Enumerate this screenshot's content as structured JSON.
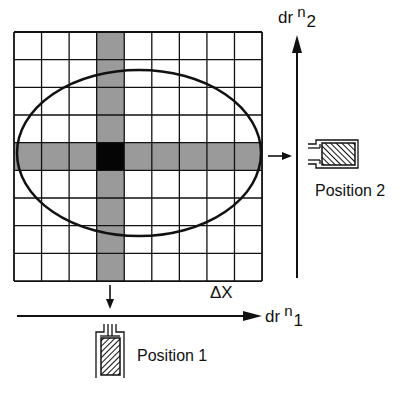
{
  "diagram": {
    "grid": {
      "x": 14,
      "y": 32,
      "cols": 9,
      "rows": 9,
      "cell_w": 27.56,
      "cell_h": 27.67,
      "shaded_col": 3,
      "shaded_row": 4,
      "center_cell": [
        3,
        4
      ]
    },
    "colors": {
      "line": "#111111",
      "shaded": "#9a9a9a",
      "center": "#050505",
      "background": "#ffffff"
    },
    "ellipse": {
      "cx": 139,
      "cy": 153,
      "rx": 122,
      "ry": 83
    },
    "axes": {
      "horizontal": {
        "label_main": "dr",
        "label_sup": "n",
        "label_sub": "1"
      },
      "vertical": {
        "label_main": "dr",
        "label_sup": "n",
        "label_sub": "2"
      }
    },
    "delta_label": "ΔX",
    "detectors": [
      {
        "label": "Position 1",
        "orientation": "vertical"
      },
      {
        "label": "Position 2",
        "orientation": "horizontal"
      }
    ]
  }
}
